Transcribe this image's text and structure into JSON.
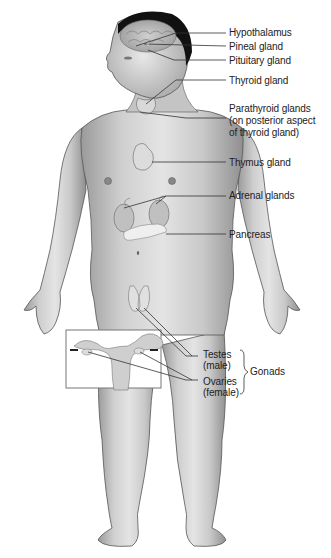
{
  "figure": {
    "labels": {
      "hypothalamus": "Hypothalamus",
      "pineal": "Pineal gland",
      "pituitary": "Pituitary gland",
      "thyroid": "Thyroid gland",
      "parathyroid_1": "Parathyroid glands",
      "parathyroid_2": "(on posterior aspect",
      "parathyroid_3": "of thyroid gland)",
      "thymus": "Thymus gland",
      "adrenal": "Adrenal glands",
      "pancreas": "Pancreas",
      "testes_1": "Testes",
      "testes_2": "(male)",
      "ovaries_1": "Ovaries",
      "ovaries_2": "(female)",
      "gonads": "Gonads"
    },
    "colors": {
      "skin_light": "#e6e6e6",
      "skin_mid": "#b8b8b8",
      "skin_dark": "#8a8a8a",
      "outline": "#555555",
      "hair": "#111111",
      "leader_line": "#333333",
      "inset_border": "#777777"
    }
  }
}
